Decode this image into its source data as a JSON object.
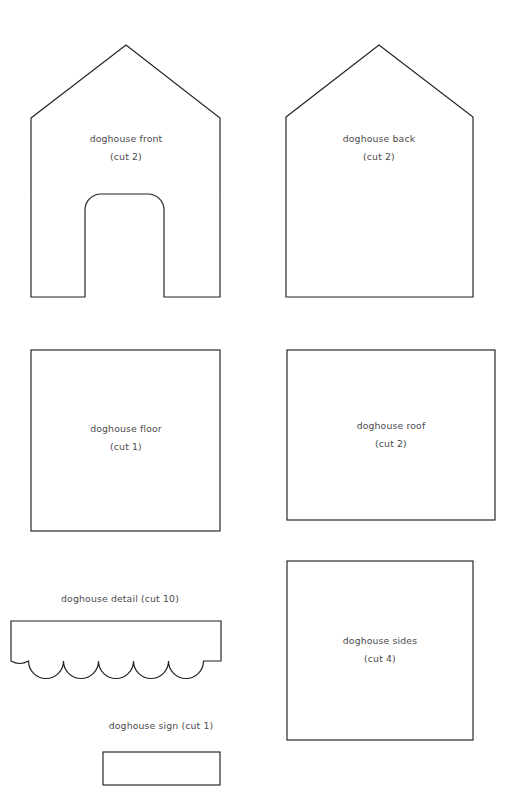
{
  "document": {
    "kind": "sewing-pattern-sheet",
    "width": 514,
    "height": 795,
    "background_color": "#ffffff",
    "line_color": "#231f20",
    "text_color": "#4a4a4c"
  },
  "header": {
    "fragment_left": "",
    "fragment_mid": "",
    "fragment_right": ""
  },
  "pieces": [
    {
      "id": "doghouse-front",
      "name": "doghouse front",
      "cut": "(cut 2)",
      "shape": "house-pentagon-with-arched-door",
      "label_x": 126,
      "label_y": 142,
      "sub_y": 160
    },
    {
      "id": "doghouse-back",
      "name": "doghouse back",
      "cut": "(cut 2)",
      "shape": "house-pentagon",
      "label_x": 379,
      "label_y": 142,
      "sub_y": 160
    },
    {
      "id": "doghouse-floor",
      "name": "doghouse floor",
      "cut": "(cut 1)",
      "shape": "rectangle",
      "label_x": 126,
      "label_y": 432,
      "sub_y": 450
    },
    {
      "id": "doghouse-roof",
      "name": "doghouse roof",
      "cut": "(cut 2)",
      "shape": "rectangle",
      "label_x": 391,
      "label_y": 429,
      "sub_y": 447
    },
    {
      "id": "doghouse-detail",
      "name": "doghouse detail (cut 10)",
      "cut": "",
      "shape": "scalloped-strip",
      "label_x": 120,
      "label_y": 602,
      "sub_y": 0
    },
    {
      "id": "doghouse-sides",
      "name": "doghouse sides",
      "cut": "(cut 4)",
      "shape": "rectangle",
      "label_x": 380,
      "label_y": 644,
      "sub_y": 662
    },
    {
      "id": "doghouse-sign",
      "name": "doghouse sign (cut 1)",
      "cut": "",
      "shape": "rectangle",
      "label_x": 161,
      "label_y": 729,
      "sub_y": 0
    }
  ],
  "geometry": {
    "front": {
      "left_x": 31,
      "right_x": 220,
      "eave_y": 118,
      "peak_x": 126,
      "peak_y": 45,
      "bottom_y": 297,
      "door_left_x": 85,
      "door_right_x": 164,
      "door_top_y": 194,
      "door_corner_radius": 16
    },
    "back": {
      "left_x": 286,
      "right_x": 473,
      "eave_y": 117,
      "peak_x": 379,
      "peak_y": 45,
      "bottom_y": 297
    },
    "floor": {
      "x": 31,
      "y": 350,
      "w": 189,
      "h": 181
    },
    "roof": {
      "x": 287,
      "y": 350,
      "w": 208,
      "h": 170
    },
    "detail": {
      "x": 11,
      "y": 621,
      "w": 210,
      "flat_h": 24,
      "scallop_count": 6,
      "scallop_depth": 16
    },
    "sides": {
      "x": 287,
      "y": 561,
      "w": 186,
      "h": 179
    },
    "sign": {
      "x": 103,
      "y": 752,
      "w": 117,
      "h": 33
    }
  }
}
